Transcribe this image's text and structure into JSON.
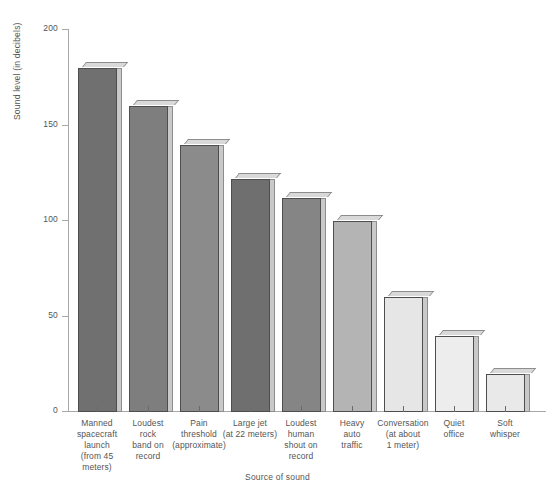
{
  "chart_data": {
    "type": "bar",
    "title": "",
    "xlabel": "Source of sound",
    "ylabel": "Sound level (in decibels)",
    "ylim": [
      0,
      200
    ],
    "yticks": [
      0,
      50,
      100,
      150,
      200
    ],
    "grid": false,
    "legend": "none",
    "categories": [
      "Manned spacecraft launch (from 45 meters)",
      "Loudest rock band on record",
      "Pain threshold (approximate)",
      "Large jet (at 22 meters)",
      "Loudest human shout on record",
      "Heavy auto traffic",
      "Conversation (at about 1 meter)",
      "Quiet office",
      "Soft whisper"
    ],
    "category_lines": [
      [
        "Manned",
        "spacecraft",
        "launch",
        "(from 45",
        "meters)"
      ],
      [
        "Loudest",
        "rock",
        "band on",
        "record"
      ],
      [
        "Pain",
        "threshold",
        "(approximate)"
      ],
      [
        "Large jet",
        "(at 22 meters)"
      ],
      [
        "Loudest",
        "human",
        "shout on",
        "record"
      ],
      [
        "Heavy",
        "auto",
        "traffic"
      ],
      [
        "Conversation",
        "(at about",
        "1 meter)"
      ],
      [
        "Quiet",
        "office"
      ],
      [
        "Soft",
        "whisper"
      ]
    ],
    "values": [
      180,
      160,
      140,
      122,
      112,
      100,
      60,
      40,
      20
    ],
    "bar_colors": [
      "#707070",
      "#7e7e7e",
      "#8b8b8b",
      "#6f6f6f",
      "#858585",
      "#b4b4b4",
      "#e6e6e6",
      "#ededed",
      "#e9e9e9"
    ],
    "axis_color": "#a8a8a8",
    "text_color": "#555555",
    "background": "#ffffff"
  }
}
